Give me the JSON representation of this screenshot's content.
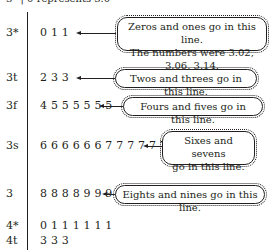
{
  "key": "3* | 0 represents 3.0",
  "rows": [
    {
      "stem": "3*",
      "leaves": "0 1 1",
      "note": [
        "Zeros and ones go in this line.",
        "The numbers were 3.02, 3.06, 3.14."
      ]
    },
    {
      "stem": "3t",
      "leaves": "2 3 3",
      "note": [
        "Twos and threes go in this line."
      ]
    },
    {
      "stem": "3f",
      "leaves": "4 5 5 5 5 5 5",
      "note": [
        "Fours and fives go in this line."
      ]
    },
    {
      "stem": "3s",
      "leaves": "6 6 6 6 6 6 7 7 7 7 7 7",
      "note": [
        "Sixes and sevens",
        "go in this line."
      ]
    },
    {
      "stem": "3",
      "leaves": "8 8 8 8 9 9 9 9",
      "note": [
        "Eights and nines go in this line."
      ]
    },
    {
      "stem": "4*",
      "leaves": "0 1 1 1 1 1 1"
    },
    {
      "stem": "4t",
      "leaves": "3 3 3"
    }
  ]
}
